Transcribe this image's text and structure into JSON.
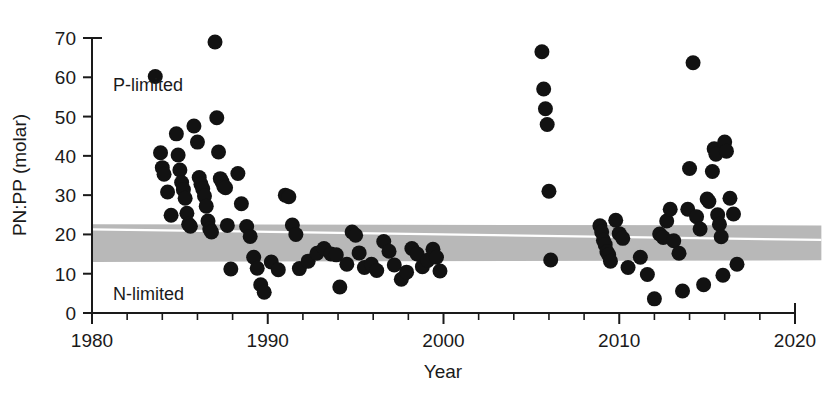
{
  "chart_data": {
    "type": "scatter",
    "title": "",
    "xlabel": "Year",
    "ylabel": "PN:PP (molar)",
    "xlim": [
      1980,
      2020
    ],
    "ylim": [
      0,
      70
    ],
    "xticks": [
      1980,
      1990,
      2000,
      2010,
      2020
    ],
    "xtick_labels": [
      "1980",
      "1990",
      "2000",
      "2010",
      "2020"
    ],
    "xminor_step": 2,
    "yticks": [
      0,
      10,
      20,
      30,
      40,
      50,
      60,
      70
    ],
    "ytick_labels": [
      "0",
      "10",
      "20",
      "30",
      "40",
      "50",
      "60",
      "70"
    ],
    "grid": false,
    "legend": "none",
    "annotations": [
      {
        "text": "P-limited",
        "x": 1981.2,
        "y": 56.5
      },
      {
        "text": "N-limited",
        "x": 1981.2,
        "y": 3.2
      }
    ],
    "band": {
      "label": "Redfield ratio range",
      "color": "#b8b8b8",
      "y_top_start": 22.6,
      "y_top_end": 22.3,
      "y_bottom_start": 13.0,
      "y_bottom_end": 13.4,
      "x_start": 1980,
      "x_end": 2021.5
    },
    "trend_line": {
      "color": "#ffffff",
      "x_start": 1980,
      "y_start": 21.3,
      "x_end": 2021.5,
      "y_end": 18.6
    },
    "marker": {
      "shape": "circle",
      "color": "#121212",
      "radius_px": 7.5
    },
    "points": [
      [
        1983.6,
        60.2
      ],
      [
        1983.9,
        40.8
      ],
      [
        1984.0,
        37.0
      ],
      [
        1984.1,
        35.3
      ],
      [
        1984.3,
        30.8
      ],
      [
        1984.5,
        24.9
      ],
      [
        1984.8,
        45.6
      ],
      [
        1984.9,
        40.2
      ],
      [
        1985.0,
        36.4
      ],
      [
        1985.1,
        33.2
      ],
      [
        1985.2,
        31.4
      ],
      [
        1985.3,
        29.2
      ],
      [
        1985.4,
        25.4
      ],
      [
        1985.5,
        22.6
      ],
      [
        1985.6,
        22.1
      ],
      [
        1985.8,
        47.6
      ],
      [
        1986.0,
        43.5
      ],
      [
        1986.1,
        34.5
      ],
      [
        1986.2,
        32.8
      ],
      [
        1986.3,
        31.6
      ],
      [
        1986.4,
        29.8
      ],
      [
        1986.5,
        27.2
      ],
      [
        1986.6,
        23.4
      ],
      [
        1986.7,
        21.4
      ],
      [
        1986.8,
        20.6
      ],
      [
        1987.0,
        69.0
      ],
      [
        1987.1,
        49.7
      ],
      [
        1987.2,
        41.0
      ],
      [
        1987.3,
        34.2
      ],
      [
        1987.4,
        33.4
      ],
      [
        1987.5,
        32.2
      ],
      [
        1987.6,
        31.9
      ],
      [
        1987.7,
        22.3
      ],
      [
        1987.9,
        11.2
      ],
      [
        1988.3,
        35.5
      ],
      [
        1988.5,
        27.8
      ],
      [
        1988.8,
        22.0
      ],
      [
        1989.0,
        19.5
      ],
      [
        1989.2,
        14.2
      ],
      [
        1989.4,
        11.4
      ],
      [
        1989.6,
        7.2
      ],
      [
        1989.8,
        5.3
      ],
      [
        1990.2,
        13.0
      ],
      [
        1990.6,
        11.0
      ],
      [
        1991.0,
        30.0
      ],
      [
        1991.2,
        29.6
      ],
      [
        1991.4,
        22.4
      ],
      [
        1991.6,
        20.0
      ],
      [
        1991.8,
        11.3
      ],
      [
        1992.3,
        13.2
      ],
      [
        1992.8,
        15.2
      ],
      [
        1993.2,
        16.4
      ],
      [
        1993.6,
        15.0
      ],
      [
        1993.9,
        14.8
      ],
      [
        1994.1,
        6.6
      ],
      [
        1994.5,
        12.4
      ],
      [
        1994.8,
        20.6
      ],
      [
        1995.0,
        19.8
      ],
      [
        1995.2,
        15.3
      ],
      [
        1995.5,
        11.6
      ],
      [
        1995.9,
        12.4
      ],
      [
        1996.2,
        10.8
      ],
      [
        1996.6,
        18.2
      ],
      [
        1996.9,
        15.7
      ],
      [
        1997.2,
        12.2
      ],
      [
        1997.6,
        8.6
      ],
      [
        1997.9,
        10.4
      ],
      [
        1998.2,
        16.4
      ],
      [
        1998.5,
        15.0
      ],
      [
        1998.8,
        11.8
      ],
      [
        1999.1,
        13.4
      ],
      [
        1999.4,
        16.2
      ],
      [
        1999.6,
        14.2
      ],
      [
        1999.8,
        10.7
      ],
      [
        2005.6,
        66.5
      ],
      [
        2005.7,
        57.0
      ],
      [
        2005.8,
        52.0
      ],
      [
        2005.9,
        48.0
      ],
      [
        2006.0,
        31.0
      ],
      [
        2006.1,
        13.5
      ],
      [
        2008.9,
        22.2
      ],
      [
        2009.0,
        20.6
      ],
      [
        2009.1,
        18.5
      ],
      [
        2009.2,
        17.4
      ],
      [
        2009.3,
        15.6
      ],
      [
        2009.4,
        14.8
      ],
      [
        2009.5,
        13.2
      ],
      [
        2009.8,
        23.6
      ],
      [
        2010.0,
        20.2
      ],
      [
        2010.2,
        19.0
      ],
      [
        2010.5,
        11.6
      ],
      [
        2011.2,
        14.2
      ],
      [
        2011.6,
        9.8
      ],
      [
        2012.0,
        3.6
      ],
      [
        2012.3,
        20.1
      ],
      [
        2012.5,
        19.2
      ],
      [
        2012.7,
        23.4
      ],
      [
        2012.9,
        26.4
      ],
      [
        2013.1,
        18.4
      ],
      [
        2013.4,
        15.2
      ],
      [
        2013.6,
        5.6
      ],
      [
        2013.9,
        26.4
      ],
      [
        2014.0,
        36.8
      ],
      [
        2014.2,
        63.7
      ],
      [
        2014.4,
        24.5
      ],
      [
        2014.6,
        21.4
      ],
      [
        2014.8,
        7.2
      ],
      [
        2015.0,
        29.0
      ],
      [
        2015.1,
        28.4
      ],
      [
        2015.3,
        36.0
      ],
      [
        2015.4,
        41.8
      ],
      [
        2015.5,
        40.4
      ],
      [
        2015.6,
        25.0
      ],
      [
        2015.7,
        22.6
      ],
      [
        2015.8,
        19.4
      ],
      [
        2015.9,
        9.6
      ],
      [
        2016.0,
        43.5
      ],
      [
        2016.1,
        41.2
      ],
      [
        2016.3,
        29.2
      ],
      [
        2016.5,
        25.2
      ],
      [
        2016.7,
        12.4
      ]
    ]
  }
}
